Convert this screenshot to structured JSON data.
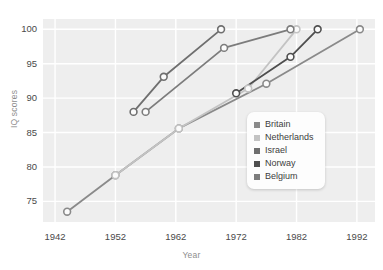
{
  "chart_data": {
    "type": "line",
    "title": "",
    "subtitle": "",
    "xlabel": "Year",
    "ylabel": "IQ scores",
    "xlim": [
      1940,
      1995
    ],
    "ylim": [
      72,
      101.5
    ],
    "xticks": [
      1942,
      1952,
      1962,
      1972,
      1982,
      1992
    ],
    "yticks": [
      75,
      80,
      85,
      90,
      95,
      100
    ],
    "grid": true,
    "legend_position": "center-right",
    "plot_bg": "#eeeeee",
    "gridline_color": "#ffffff",
    "marker": "open-circle",
    "series": [
      {
        "name": "Britain",
        "color": "#8a8a8a",
        "x": [
          1944,
          1952,
          1962.5,
          1977,
          1992.5
        ],
        "y": [
          73.5,
          78.8,
          85.6,
          92.1,
          100.0
        ]
      },
      {
        "name": "Netherlands",
        "color": "#c3c3c3",
        "x": [
          1952,
          1962.5,
          1974,
          1982
        ],
        "y": [
          78.8,
          85.6,
          91.4,
          100.0
        ]
      },
      {
        "name": "Israel",
        "color": "#6f6f6f",
        "x": [
          1955,
          1960,
          1969.5
        ],
        "y": [
          88.0,
          93.1,
          100.0
        ]
      },
      {
        "name": "Norway",
        "color": "#4f4f4f",
        "x": [
          1972,
          1981,
          1985.5
        ],
        "y": [
          90.7,
          96.0,
          100.0
        ]
      },
      {
        "name": "Belgium",
        "color": "#7c7c7c",
        "x": [
          1957,
          1970,
          1981
        ],
        "y": [
          88.0,
          97.3,
          100.0
        ]
      }
    ]
  },
  "legend": {
    "items": [
      {
        "label": "Britain",
        "color": "#8a8a8a"
      },
      {
        "label": "Netherlands",
        "color": "#c3c3c3"
      },
      {
        "label": "Israel",
        "color": "#6f6f6f"
      },
      {
        "label": "Norway",
        "color": "#4f4f4f"
      },
      {
        "label": "Belgium",
        "color": "#7c7c7c"
      }
    ]
  }
}
